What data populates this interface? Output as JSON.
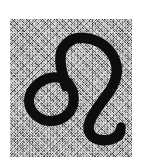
{
  "image": {
    "subject": "leo-zodiac-symbol",
    "glyph_unicode": "♌",
    "glyph_name": "Leo",
    "alt_text": "Leo zodiac sign handwritten in black ink on a noisy gray background",
    "width_px": 141,
    "height_px": 163,
    "caption": ""
  },
  "background": {
    "outer_color": "#ffffff",
    "plate_color": "#8e8e8e",
    "plate_noise": "salt-and-pepper",
    "plate_rect": {
      "x": 10,
      "y": 19,
      "width": 122,
      "height": 138
    }
  },
  "glyph": {
    "stroke_color": "#0d0d0d",
    "stroke_width_px": 10,
    "style": "hand-drawn-brush",
    "parts": [
      {
        "name": "loop",
        "description": "closed circular loop at lower left",
        "cx": 52,
        "cy": 100,
        "rx": 25,
        "ry": 21
      },
      {
        "name": "arch",
        "description": "tall rounded arch rising from loop up and over to the right",
        "apex_x": 80,
        "apex_y": 42
      },
      {
        "name": "descender",
        "description": "long S-curve sweeping down the right side",
        "x_extent": [
          95,
          120
        ]
      },
      {
        "name": "tail-hook",
        "description": "hook curving right then tipping upward at the end",
        "end_x": 121,
        "end_y": 131
      }
    ]
  }
}
